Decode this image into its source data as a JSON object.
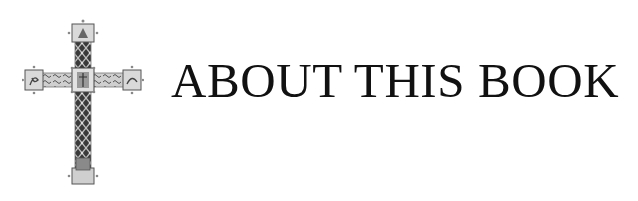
{
  "header": {
    "title": "ABOUT THIS BOOK",
    "emblem": "processional-cross-icon"
  },
  "colors": {
    "text": "#111111",
    "background": "#ffffff",
    "cross_dark": "#2a2a2a",
    "cross_mid": "#8a8a8a",
    "cross_light": "#d6d6d6"
  }
}
